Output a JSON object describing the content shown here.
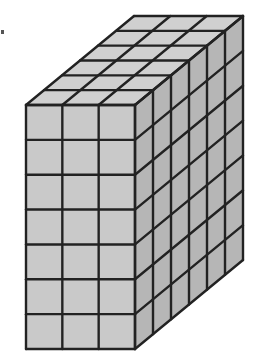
{
  "figure": {
    "dimensions": {
      "width_cubes": 3,
      "height_cubes": 7,
      "depth_cubes": 6
    },
    "total_cubes": 126,
    "colors": {
      "front": "#c9c9c9",
      "top": "#d0d0d0",
      "side": "#b6b6b6",
      "line": "#222222"
    },
    "geometry": {
      "front_left": 26,
      "front_top": 105,
      "front_right": 135,
      "front_bottom": 349,
      "depth_dx": 108,
      "depth_dy": -89
    }
  }
}
